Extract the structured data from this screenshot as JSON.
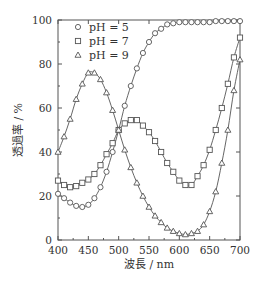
{
  "chart_data": {
    "type": "line",
    "title": "",
    "xlabel": "波長 / nm",
    "ylabel": "透過率 / %",
    "xlim": [
      400,
      700
    ],
    "ylim": [
      0,
      100
    ],
    "xticks": [
      400,
      450,
      500,
      550,
      600,
      650,
      700
    ],
    "yticks": [
      0,
      20,
      40,
      60,
      80,
      100
    ],
    "grid": false,
    "legend_position": "upper left",
    "series": [
      {
        "name": "pH = 5",
        "marker": "circle",
        "x": [
          400,
          410,
          420,
          430,
          440,
          450,
          460,
          470,
          480,
          490,
          500,
          510,
          520,
          530,
          540,
          550,
          560,
          570,
          580,
          590,
          600,
          610,
          620,
          630,
          640,
          650,
          660,
          670,
          680,
          690,
          700
        ],
        "values": [
          21,
          19,
          17,
          15.5,
          15,
          16,
          19,
          24,
          31,
          40,
          50,
          61,
          70,
          78,
          85,
          90,
          94,
          96,
          98,
          98.5,
          99,
          99,
          99,
          99,
          99,
          99,
          99.5,
          99.5,
          99.5,
          99.5,
          99.5
        ]
      },
      {
        "name": "pH = 7",
        "marker": "square",
        "x": [
          400,
          410,
          420,
          430,
          440,
          450,
          460,
          470,
          480,
          490,
          500,
          510,
          520,
          530,
          540,
          550,
          560,
          570,
          580,
          590,
          600,
          610,
          620,
          630,
          640,
          650,
          660,
          670,
          680,
          690,
          700
        ],
        "values": [
          27,
          25,
          24,
          24.5,
          26,
          27.5,
          30,
          34,
          39,
          44,
          50,
          53,
          54.5,
          54.5,
          52,
          49,
          45,
          40,
          35,
          31,
          27,
          25,
          25,
          29,
          34,
          41,
          50,
          60,
          71,
          83,
          92
        ]
      },
      {
        "name": "pH = 9",
        "marker": "triangle",
        "x": [
          400,
          410,
          420,
          430,
          440,
          450,
          460,
          470,
          480,
          490,
          500,
          510,
          520,
          530,
          540,
          550,
          560,
          570,
          580,
          590,
          600,
          610,
          620,
          630,
          640,
          650,
          660,
          670,
          680,
          690,
          700
        ],
        "values": [
          40,
          47,
          55,
          64,
          71,
          76,
          76,
          73,
          67,
          59,
          50,
          41,
          33,
          26,
          20,
          15,
          11,
          8,
          5.5,
          4,
          3,
          2.5,
          3,
          4,
          7,
          13,
          22,
          35,
          50,
          68,
          82
        ]
      }
    ]
  },
  "legend": {
    "items": [
      "pH = 5",
      "pH = 7",
      "pH = 9"
    ]
  },
  "axes": {
    "xlabel": "波長 / nm",
    "ylabel": "透過率 / %",
    "xtick_labels": [
      "400",
      "450",
      "500",
      "550",
      "600",
      "650",
      "700"
    ],
    "ytick_labels": [
      "0",
      "20",
      "40",
      "60",
      "80",
      "100"
    ]
  }
}
